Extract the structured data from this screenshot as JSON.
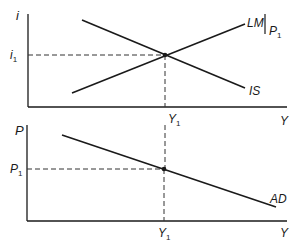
{
  "diagram": {
    "colors": {
      "ink": "#1a1a1a",
      "dash": "#333333"
    },
    "top_panel": {
      "y_axis_label": "i",
      "x_axis_label": "Y",
      "equilibrium_y_label": "i",
      "equilibrium_y_sub": "1",
      "equilibrium_x_label": "Y",
      "equilibrium_x_sub": "1",
      "curves": [
        {
          "name": "LM",
          "label": "LM",
          "qualifier": "P",
          "qualifier_sub": "1",
          "slope": "upward"
        },
        {
          "name": "IS",
          "label": "IS",
          "slope": "downward"
        }
      ]
    },
    "bottom_panel": {
      "y_axis_label": "P",
      "x_axis_label": "Y",
      "equilibrium_y_label": "P",
      "equilibrium_y_sub": "1",
      "equilibrium_x_label": "Y",
      "equilibrium_x_sub": "1",
      "curves": [
        {
          "name": "AD",
          "label": "AD",
          "slope": "downward"
        }
      ]
    }
  }
}
